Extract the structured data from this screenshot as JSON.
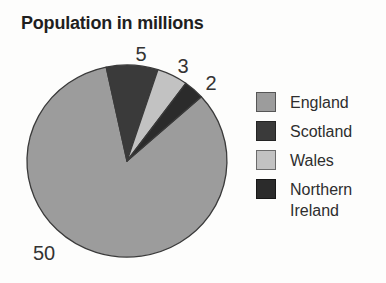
{
  "page": {
    "background": "#fdfdfc"
  },
  "chart_data": {
    "type": "pie",
    "title": "Population in millions",
    "unit": "millions",
    "categories": [
      "England",
      "Scotland",
      "Wales",
      "Northern Ireland"
    ],
    "values": [
      50,
      5,
      3,
      2
    ],
    "total": 60,
    "legend_position": "right",
    "slices": [
      {
        "name": "England",
        "value": 50,
        "color": "#9c9c9c",
        "border_color": "#565656",
        "label_pos": [
          44,
          253
        ]
      },
      {
        "name": "Scotland",
        "value": 5,
        "color": "#3a3a3a",
        "border_color": "#242424",
        "label_pos": [
          141,
          54
        ]
      },
      {
        "name": "Wales",
        "value": 3,
        "color": "#c2c2c2",
        "border_color": "#6b6b6b",
        "label_pos": [
          183,
          66
        ]
      },
      {
        "name": "Northern Ireland",
        "value": 2,
        "color": "#2b2b2b",
        "border_color": "#171717",
        "label_pos": [
          211,
          83
        ]
      }
    ],
    "geometry": {
      "cx": 127,
      "cy": 161,
      "rx": 100,
      "ry": 96,
      "start_angle_deg": 48,
      "outline_color": "#3a3a3a"
    }
  }
}
